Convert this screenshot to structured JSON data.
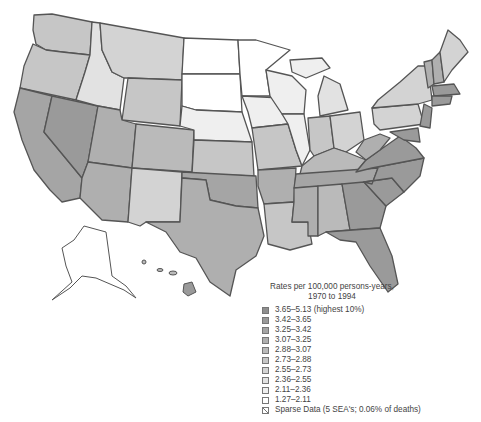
{
  "legend": {
    "title_line1": "Rates per 100,000 persons-years,",
    "title_line2": "1970 to 1994",
    "items": [
      {
        "label": "3.65–5.13 (highest 10%)",
        "color": "#8f8f8f"
      },
      {
        "label": "3.42–3.65",
        "color": "#9a9a9a"
      },
      {
        "label": "3.25–3.42",
        "color": "#a5a5a5"
      },
      {
        "label": "3.07–3.25",
        "color": "#afafaf"
      },
      {
        "label": "2.88–3.07",
        "color": "#bababa"
      },
      {
        "label": "2.73–2.88",
        "color": "#c6c6c6"
      },
      {
        "label": "2.55–2.73",
        "color": "#d3d3d3"
      },
      {
        "label": "2.36–2.55",
        "color": "#e2e2e2"
      },
      {
        "label": "2.11–2.36",
        "color": "#efefef"
      },
      {
        "label": "1.27–2.11",
        "color": "#ffffff"
      },
      {
        "label": "Sparse Data (5 SEA's; 0.06% of deaths)",
        "color": "sparse"
      }
    ]
  },
  "map": {
    "region": "United States (contiguous, Alaska, Hawaii)",
    "state_border_color": "#555555"
  }
}
